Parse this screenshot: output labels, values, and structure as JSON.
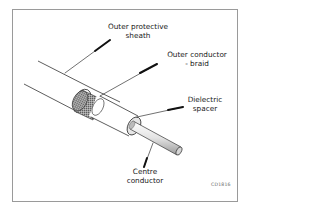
{
  "diagram": {
    "labels": {
      "outer_sheath": "Outer protective\nsheath",
      "outer_conductor": "Outer conductor\n- braid",
      "dielectric": "Dielectric\nspacer",
      "centre_conductor": "Centre\nconductor"
    },
    "figure_code": "CD1816"
  },
  "colors": {
    "frame": "#9a9a9a",
    "line": "#222222",
    "braid": "#8a8a8a",
    "leader": "#111111"
  }
}
